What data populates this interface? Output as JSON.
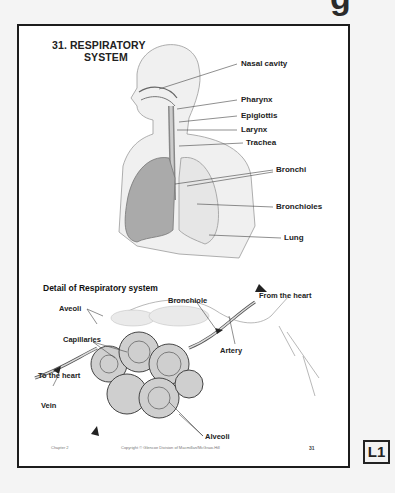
{
  "background_heading_fragment": "g",
  "card": {
    "title_line1": "31. RESPIRATORY",
    "title_line2": "SYSTEM",
    "upper_labels": {
      "nasal_cavity": "Nasal cavity",
      "pharynx": "Pharynx",
      "epiglottis": "Epiglottis",
      "larynx": "Larynx",
      "trachea": "Trachea",
      "bronchi": "Bronchi",
      "bronchioles": "Bronchioles",
      "lung": "Lung"
    },
    "detail_title": "Detail of Respiratory system",
    "detail_labels": {
      "aveoli": "Aveoli",
      "bronchiole": "Bronchiole",
      "from_the_heart": "From the heart",
      "capillaries": "Capillaries",
      "artery": "Artery",
      "to_the_heart": "To the heart",
      "vein": "Vein",
      "alveoli": "Alveoli"
    },
    "footer": {
      "left": "Chapter 2",
      "center": "Copyright © Glencoe Division of Macmillan/McGraw-Hill",
      "page": "31"
    }
  },
  "badge": "L1"
}
